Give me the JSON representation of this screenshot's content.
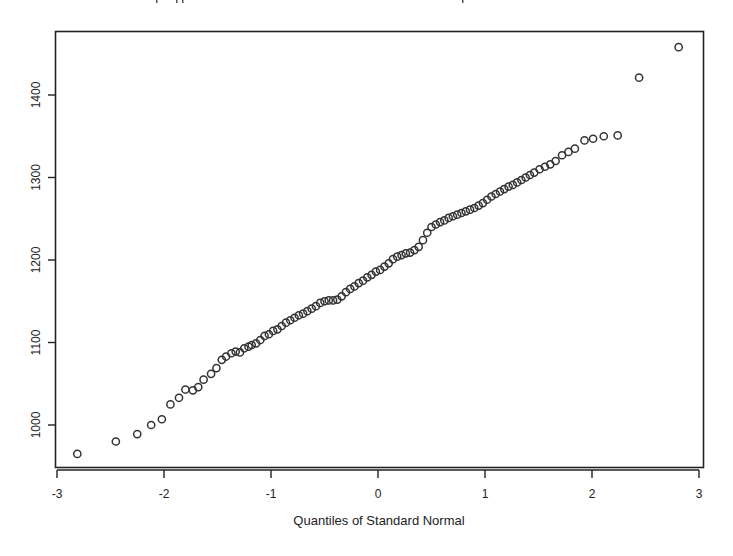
{
  "chart_data": {
    "type": "scatter",
    "title": "",
    "xlabel": "Quantiles of Standard Normal",
    "ylabel": "",
    "xlim": [
      -3,
      3
    ],
    "ylim": [
      950,
      1470
    ],
    "grid": false,
    "legend": null,
    "x_ticks": [
      -3,
      -2,
      -1,
      0,
      1,
      2,
      3
    ],
    "x_tick_labels": [
      "-3",
      "-2",
      "-1",
      "0",
      "1",
      "2",
      "3"
    ],
    "y_ticks": [
      1000,
      1100,
      1200,
      1300,
      1400
    ],
    "y_tick_labels": [
      "1000",
      "1100",
      "1200",
      "1300",
      "1400"
    ],
    "marker": "open-circle",
    "colors": {
      "marker": "#333333",
      "axis": "#222222",
      "background": "#ffffff"
    },
    "series": [
      {
        "name": "sample quantiles",
        "points": [
          [
            -2.81,
            965
          ],
          [
            -2.45,
            980
          ],
          [
            -2.25,
            989
          ],
          [
            -2.12,
            1000
          ],
          [
            -2.02,
            1007
          ],
          [
            -1.94,
            1025
          ],
          [
            -1.86,
            1033
          ],
          [
            -1.8,
            1043
          ],
          [
            -1.73,
            1042
          ],
          [
            -1.68,
            1046
          ],
          [
            -1.63,
            1055
          ],
          [
            -1.56,
            1062
          ],
          [
            -1.51,
            1069
          ],
          [
            -1.46,
            1079
          ],
          [
            -1.42,
            1083
          ],
          [
            -1.37,
            1087
          ],
          [
            -1.33,
            1089
          ],
          [
            -1.29,
            1088
          ],
          [
            -1.25,
            1093
          ],
          [
            -1.21,
            1095
          ],
          [
            -1.18,
            1097
          ],
          [
            -1.14,
            1099
          ],
          [
            -1.1,
            1103
          ],
          [
            -1.06,
            1108
          ],
          [
            -1.02,
            1110
          ],
          [
            -0.98,
            1114
          ],
          [
            -0.94,
            1116
          ],
          [
            -0.9,
            1120
          ],
          [
            -0.86,
            1124
          ],
          [
            -0.82,
            1127
          ],
          [
            -0.78,
            1130
          ],
          [
            -0.74,
            1133
          ],
          [
            -0.7,
            1135
          ],
          [
            -0.66,
            1138
          ],
          [
            -0.62,
            1141
          ],
          [
            -0.58,
            1144
          ],
          [
            -0.54,
            1148
          ],
          [
            -0.5,
            1150
          ],
          [
            -0.46,
            1151
          ],
          [
            -0.42,
            1151
          ],
          [
            -0.38,
            1152
          ],
          [
            -0.34,
            1156
          ],
          [
            -0.3,
            1161
          ],
          [
            -0.26,
            1165
          ],
          [
            -0.22,
            1168
          ],
          [
            -0.18,
            1172
          ],
          [
            -0.14,
            1175
          ],
          [
            -0.1,
            1179
          ],
          [
            -0.06,
            1182
          ],
          [
            -0.02,
            1186
          ],
          [
            0.02,
            1188
          ],
          [
            0.06,
            1192
          ],
          [
            0.1,
            1196
          ],
          [
            0.14,
            1201
          ],
          [
            0.18,
            1204
          ],
          [
            0.22,
            1206
          ],
          [
            0.26,
            1208
          ],
          [
            0.3,
            1209
          ],
          [
            0.34,
            1212
          ],
          [
            0.38,
            1216
          ],
          [
            0.42,
            1224
          ],
          [
            0.46,
            1233
          ],
          [
            0.5,
            1240
          ],
          [
            0.54,
            1243
          ],
          [
            0.58,
            1246
          ],
          [
            0.62,
            1248
          ],
          [
            0.66,
            1251
          ],
          [
            0.7,
            1253
          ],
          [
            0.74,
            1255
          ],
          [
            0.78,
            1257
          ],
          [
            0.82,
            1259
          ],
          [
            0.86,
            1261
          ],
          [
            0.9,
            1263
          ],
          [
            0.94,
            1266
          ],
          [
            0.98,
            1269
          ],
          [
            1.02,
            1273
          ],
          [
            1.06,
            1277
          ],
          [
            1.1,
            1280
          ],
          [
            1.14,
            1283
          ],
          [
            1.18,
            1286
          ],
          [
            1.22,
            1289
          ],
          [
            1.26,
            1291
          ],
          [
            1.3,
            1294
          ],
          [
            1.34,
            1297
          ],
          [
            1.38,
            1300
          ],
          [
            1.42,
            1303
          ],
          [
            1.46,
            1306
          ],
          [
            1.51,
            1310
          ],
          [
            1.56,
            1313
          ],
          [
            1.61,
            1316
          ],
          [
            1.66,
            1320
          ],
          [
            1.72,
            1327
          ],
          [
            1.78,
            1331
          ],
          [
            1.84,
            1335
          ],
          [
            1.93,
            1345
          ],
          [
            2.01,
            1347
          ],
          [
            2.11,
            1350
          ],
          [
            2.24,
            1351
          ],
          [
            2.44,
            1421
          ],
          [
            2.81,
            1458
          ]
        ]
      }
    ]
  },
  "axes": {
    "x_title": "Quantiles of Standard Normal"
  }
}
